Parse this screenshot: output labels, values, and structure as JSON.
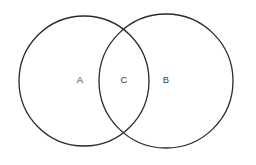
{
  "figure": {
    "type": "venn-diagram",
    "set_count": 2,
    "background_color": "#ffffff",
    "stroke_color": "#2b2b2b",
    "label_color": "#3a3a3a",
    "width": 256,
    "height": 165
  },
  "circles": [
    {
      "id": "left-circle",
      "name": "set-a-circle",
      "cx": 84,
      "cy": 81,
      "r": 65
    },
    {
      "id": "right-circle",
      "name": "set-b-circle",
      "cx": 166,
      "cy": 81,
      "r": 67
    }
  ],
  "labels": [
    {
      "id": "label-a",
      "text": "A",
      "x": 80,
      "y": 80,
      "region": "left-only"
    },
    {
      "id": "label-c",
      "text": "C",
      "x": 124,
      "y": 80,
      "region": "intersection"
    },
    {
      "id": "label-b",
      "text": "B",
      "x": 166,
      "y": 80,
      "region": "right-only"
    }
  ]
}
